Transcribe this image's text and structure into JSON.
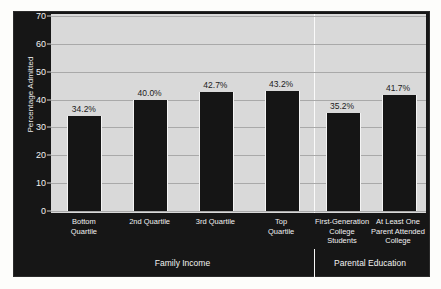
{
  "chart_data": {
    "type": "bar",
    "title": "",
    "xlabel": "",
    "ylabel": "Percentage Admitted",
    "ylim": [
      0,
      70
    ],
    "yticks": [
      0,
      10,
      20,
      30,
      40,
      50,
      60,
      70
    ],
    "grid": true,
    "legend": "none",
    "categories": [
      "Bottom Quartile",
      "2nd Quartile",
      "3rd Quartile",
      "Top Quartile",
      "First-Generation College Students",
      "At Least One Parent Attended College"
    ],
    "values": [
      34.2,
      40.0,
      42.7,
      43.2,
      35.2,
      41.7
    ],
    "value_labels": [
      "34.2%",
      "40.0%",
      "42.7%",
      "43.2%",
      "35.2%",
      "41.7%"
    ],
    "bars": [
      {
        "label_lines": [
          "Bottom",
          "Quartile"
        ],
        "value": 34.2,
        "value_label": "34.2%",
        "group": "Family Income"
      },
      {
        "label_lines": [
          "2nd Quartile"
        ],
        "value": 40.0,
        "value_label": "40.0%",
        "group": "Family Income"
      },
      {
        "label_lines": [
          "3rd Quartile"
        ],
        "value": 42.7,
        "value_label": "42.7%",
        "group": "Family Income"
      },
      {
        "label_lines": [
          "Top",
          "Quartile"
        ],
        "value": 43.2,
        "value_label": "43.2%",
        "group": "Family Income"
      },
      {
        "label_lines": [
          "First-Generation",
          "College Students"
        ],
        "value": 35.2,
        "value_label": "35.2%",
        "group": "Parental Education"
      },
      {
        "label_lines": [
          "At Least One",
          "Parent Attended",
          "College"
        ],
        "value": 41.7,
        "value_label": "41.7%",
        "group": "Parental Education"
      }
    ],
    "groups": [
      {
        "name": "Family Income",
        "bar_indices": [
          0,
          1,
          2,
          3
        ]
      },
      {
        "name": "Parental Education",
        "bar_indices": [
          4,
          5
        ]
      }
    ],
    "colors": {
      "bar": "#151515",
      "plot_background": "#d9d9d9",
      "frame_background": "#161616",
      "gridline": "#a9a9a9",
      "axis_text": "#f2f2f2",
      "value_label_text": "#1b1b1b",
      "figure_background": "#fdfdfb",
      "divider": "#fafafa"
    }
  },
  "y_axis": {
    "title": "Percentage Admitted",
    "tick_labels": [
      "70",
      "60",
      "50",
      "40",
      "30",
      "20",
      "10",
      "0"
    ]
  },
  "x_axis": {
    "tick_labels": [
      "Bottom\nQuartile",
      "2nd Quartile",
      "3rd Quartile",
      "Top\nQuartile",
      "First-Generation\nCollege Students",
      "At Least One\nParent Attended\nCollege"
    ]
  },
  "groups": {
    "family_income": "Family Income",
    "parental_education": "Parental Education"
  }
}
